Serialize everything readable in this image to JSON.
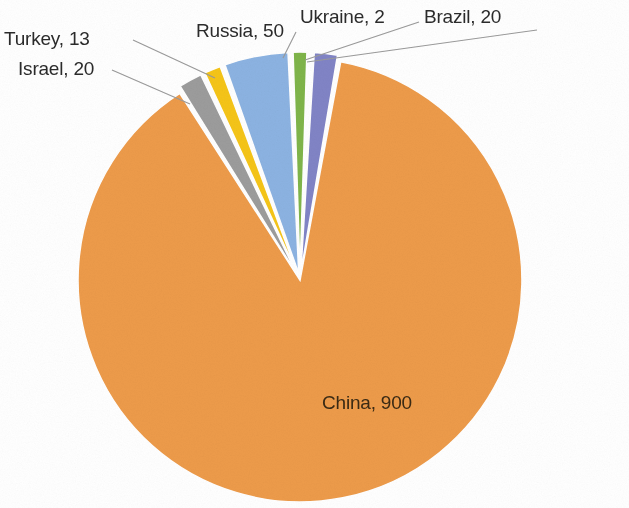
{
  "chart_data": {
    "type": "pie",
    "title": "",
    "subtitle": "",
    "xlabel": "",
    "ylabel": "",
    "legend_position": "none",
    "grid": false,
    "labels_show_name_and_value": true,
    "total": 1020,
    "categories": [
      "China",
      "Russia",
      "Israel",
      "Brazil",
      "Kazakhstan",
      "Turkey",
      "Ukraine"
    ],
    "values": [
      900,
      50,
      20,
      20,
      15,
      13,
      2
    ],
    "slices": [
      {
        "name": "China",
        "value": 900,
        "label": "China, 900",
        "color": "#ED9B4A",
        "percent": 88.24,
        "label_placement": "inside",
        "leader_line": false
      },
      {
        "name": "Israel",
        "value": 20,
        "label": "Israel, 20",
        "color": "#9C9C9C",
        "percent": 1.96,
        "label_placement": "outside-left",
        "leader_line": true
      },
      {
        "name": "Kazakhstan",
        "value": 15,
        "label": "Kazakhstan, 15",
        "color": "#F5C518",
        "percent": 1.47,
        "label_placement": "outside-left",
        "leader_line": true
      },
      {
        "name": "Russia",
        "value": 50,
        "label": "Russia, 50",
        "color": "#8CB3E2",
        "percent": 4.9,
        "label_placement": "outside-top",
        "leader_line": false
      },
      {
        "name": "Turkey",
        "value": 13,
        "label": "Turkey, 13",
        "color": "#7FB54A",
        "percent": 1.27,
        "label_placement": "outside-top",
        "leader_line": true
      },
      {
        "name": "Ukraine",
        "value": 2,
        "label": "Ukraine, 2",
        "color": "#F0F0F0",
        "percent": 0.2,
        "label_placement": "outside-top-right",
        "leader_line": true
      },
      {
        "name": "Brazil",
        "value": 20,
        "label": "Brazil, 20",
        "color": "#8184C6",
        "percent": 1.96,
        "label_placement": "outside-top-right",
        "leader_line": true
      }
    ]
  },
  "colors": {
    "background": "#ffffff",
    "orange": "#ED9B4A",
    "gray": "#9C9C9C",
    "yellow": "#F5C518",
    "blue": "#8CB3E2",
    "green": "#7FB54A",
    "purple": "#8184C6",
    "label_text": "#2b2b2b",
    "inside_label_text": "#3a2a14",
    "leader_line": "#9a9a9a"
  }
}
